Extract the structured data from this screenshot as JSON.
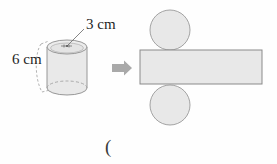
{
  "figure": {
    "labels": {
      "radius": "3 cm",
      "height": "6 cm",
      "paren": "("
    },
    "colors": {
      "fill": "#e8e8e8",
      "fill_light": "#eeeeee",
      "stroke": "#8c8c8c",
      "stroke_dark": "#707070",
      "arrow": "#a8a8a8",
      "text": "#1f1f1f"
    },
    "solid": {
      "name": "cylinder",
      "center_x": 67,
      "top_ellipse_cy": 47,
      "bottom_ellipse_cy": 88,
      "rx": 20,
      "ry": 7,
      "height_px": 41,
      "radius_label": "3 cm",
      "height_label": "6 cm"
    },
    "arrow": {
      "name": "transform-arrow",
      "direction": "right",
      "x": 112,
      "y": 68
    },
    "net": {
      "name": "cylinder-net",
      "top_circle": {
        "cx": 170,
        "cy": 30,
        "r": 20
      },
      "bottom_circle": {
        "cx": 170,
        "cy": 105,
        "r": 20
      },
      "rectangle": {
        "x": 140,
        "y": 50,
        "width": 122,
        "height": 34
      }
    }
  }
}
